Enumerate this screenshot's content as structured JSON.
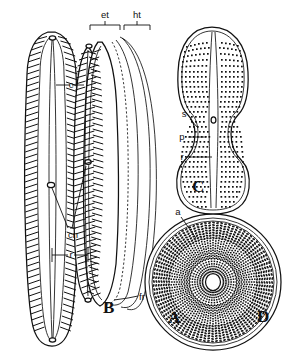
{
  "figure": {
    "kind": "scientific-line-illustration",
    "background_color": "#ffffff",
    "ink_color": "#111111",
    "width": 282,
    "height": 358
  },
  "panels": [
    {
      "id": "A",
      "letter": "A",
      "caption": "valve view, elongate linear valve with transapical striae",
      "letter_x": 168,
      "letter_y": 323
    },
    {
      "id": "B",
      "letter": "B",
      "caption": "girdle view showing epitheca and hypotheca",
      "letter_x": 103,
      "letter_y": 313
    },
    {
      "id": "C",
      "letter": "C",
      "caption": "panduriform valve with punctate striae",
      "letter_x": 192,
      "letter_y": 192
    },
    {
      "id": "D",
      "letter": "D",
      "caption": "centric valve with radial rows of areolae",
      "letter_x": 257,
      "letter_y": 322
    }
  ],
  "labels": [
    {
      "key": "et",
      "text": "et",
      "meaning": "epitheca",
      "x": 107,
      "y": 18,
      "type": "bracket"
    },
    {
      "key": "ht",
      "text": "ht",
      "meaning": "hypotheca",
      "x": 134,
      "y": 18,
      "type": "bracket"
    },
    {
      "key": "c",
      "text": "c",
      "meaning": "costa / stria",
      "x": 63,
      "y": 88,
      "type": "leader"
    },
    {
      "key": "cn",
      "text": "cn",
      "meaning": "central nodule",
      "x": 60,
      "y": 230,
      "type": "leader"
    },
    {
      "key": "r_A",
      "text": "r",
      "meaning": "raphe",
      "x": 61,
      "y": 258,
      "type": "leader"
    },
    {
      "key": "fr",
      "text": "fr",
      "meaning": "frustule band",
      "x": 139,
      "y": 300,
      "type": "leader"
    },
    {
      "key": "s",
      "text": "s",
      "meaning": "stria",
      "x": 182,
      "y": 120,
      "type": "leader"
    },
    {
      "key": "p",
      "text": "p",
      "meaning": "puncta / areola",
      "x": 180,
      "y": 139,
      "type": "leader"
    },
    {
      "key": "r_C",
      "text": "r",
      "meaning": "raphe",
      "x": 181,
      "y": 159,
      "type": "leader"
    },
    {
      "key": "a",
      "text": "a",
      "meaning": "areola",
      "x": 178,
      "y": 213,
      "type": "leader"
    }
  ]
}
